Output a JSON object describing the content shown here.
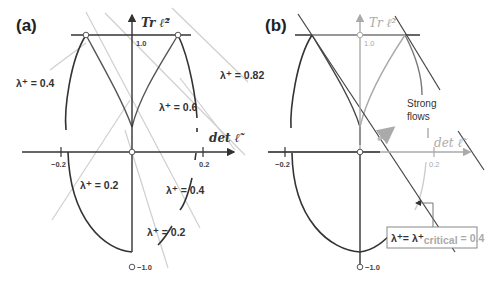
{
  "panel_a": {
    "label": "(a)",
    "y_axis_title": "Tr ℓ̃²",
    "x_axis_title": "det ℓ̃",
    "ticks": {
      "y_top": "1.0",
      "y_bottom": "−1.0",
      "x_left": "−0.2",
      "x_right": "0.2"
    },
    "lambda_labels": [
      {
        "text": "λ⁺ = 0.4"
      },
      {
        "text": "λ⁺ = 0.82"
      },
      {
        "text": "λ⁺ = 0.6"
      },
      {
        "text": "λ⁺ = 0.2"
      },
      {
        "text": "λ⁺ = 0.4"
      },
      {
        "text": "λ⁺ = 0.2"
      }
    ]
  },
  "panel_b": {
    "label": "(b)",
    "y_axis_title": "Tr ℓ̃²",
    "x_axis_title": "det ℓ̃",
    "ticks": {
      "y_top": "1.0",
      "y_bottom": "−1.0",
      "x_left": "−0.2",
      "x_right": "0.2"
    },
    "region_label_line1": "Strong",
    "region_label_line2": "flows",
    "critical_box": {
      "lhs": "λ⁺= λ⁺",
      "subscript": "critical",
      "rhs": "= 0.4"
    }
  },
  "colors": {
    "curve": "#333333",
    "gray_line": "#c8c8c8",
    "faded": "#aaaaaa",
    "axis": "#222222"
  }
}
